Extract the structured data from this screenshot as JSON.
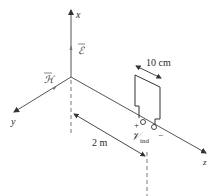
{
  "diagram": {
    "axes": {
      "x_label": "x",
      "y_label": "y",
      "z_label": "z"
    },
    "field_labels": {
      "electric_field": "ℰ",
      "magnetic_field": "ℋ"
    },
    "dimensions": {
      "loop_width": "10 cm",
      "distance": "2 m"
    },
    "terminals": {
      "plus": "+",
      "minus": "−",
      "voltage_symbol": "𝒱",
      "voltage_subscript": "ind"
    },
    "colors": {
      "line": "#3a3a3a",
      "axis": "#555555"
    }
  }
}
